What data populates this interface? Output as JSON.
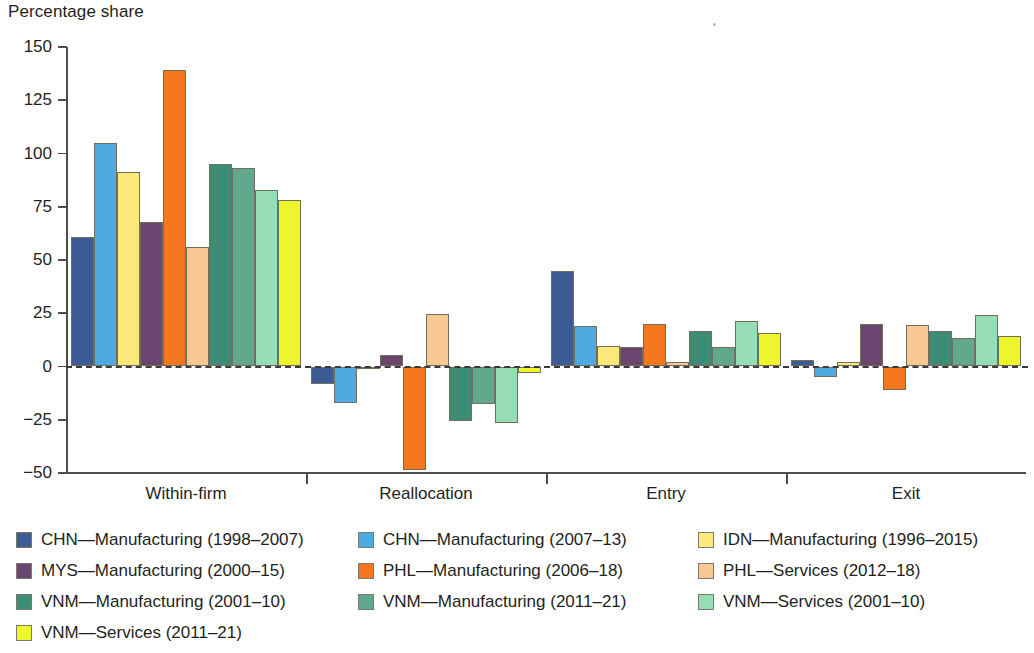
{
  "chart_data": {
    "type": "bar",
    "title": "",
    "ylabel": "Percentage share",
    "xlabel": "",
    "ylim": [
      -50,
      150
    ],
    "yticks": [
      150,
      125,
      100,
      75,
      50,
      25,
      0,
      -25,
      -50
    ],
    "ytick_labels": [
      "150",
      "125",
      "100",
      "75",
      "50",
      "25",
      "0",
      "−25",
      "−50"
    ],
    "grid": false,
    "zero_line": true,
    "legend_position": "below",
    "categories": [
      "Within-firm",
      "Reallocation",
      "Entry",
      "Exit"
    ],
    "series": [
      {
        "name": "CHN—Manufacturing (1998–2007)",
        "color": "#3c5a93",
        "values": [
          61,
          -8,
          45,
          3
        ]
      },
      {
        "name": "CHN—Manufacturing (2007–13)",
        "color": "#4eaae0",
        "values": [
          105,
          -17,
          19,
          -5
        ]
      },
      {
        "name": "IDN—Manufacturing (1996–2015)",
        "color": "#fde87a",
        "values": [
          91.5,
          -1,
          9.5,
          2
        ]
      },
      {
        "name": "MYS—Manufacturing (2000–15)",
        "color": "#6a4570",
        "values": [
          68,
          5.5,
          9,
          20
        ]
      },
      {
        "name": "PHL—Manufacturing (2006–18)",
        "color": "#f4761f",
        "values": [
          139,
          -48.5,
          20,
          -11
        ]
      },
      {
        "name": "PHL—Services (2012–18)",
        "color": "#fbc894",
        "values": [
          56,
          24.5,
          2,
          19.5
        ]
      },
      {
        "name": "VNM—Manufacturing (2001–10)",
        "color": "#3d8d76",
        "values": [
          95,
          -25.5,
          16.5,
          16.5
        ]
      },
      {
        "name": "VNM—Manufacturing (2011–21)",
        "color": "#64a78f",
        "values": [
          93,
          -17.5,
          9,
          13.5
        ]
      },
      {
        "name": "VNM—Services (2001–10)",
        "color": "#96ddb5",
        "values": [
          83,
          -26.5,
          21.5,
          24
        ]
      },
      {
        "name": "VNM—Services (2011–21)",
        "color": "#eef52a",
        "values": [
          78,
          -3,
          15.5,
          14.5
        ]
      }
    ]
  },
  "legend": {
    "rows": [
      [
        {
          "label": "CHN—Manufacturing (1998–2007)",
          "color": "#3c5a93"
        },
        {
          "label": "CHN—Manufacturing (2007–13)",
          "color": "#4eaae0"
        },
        {
          "label": "IDN—Manufacturing (1996–2015)",
          "color": "#fde87a"
        }
      ],
      [
        {
          "label": "MYS—Manufacturing (2000–15)",
          "color": "#6a4570"
        },
        {
          "label": "PHL—Manufacturing (2006–18)",
          "color": "#f4761f"
        },
        {
          "label": "PHL—Services (2012–18)",
          "color": "#fbc894"
        }
      ],
      [
        {
          "label": "VNM—Manufacturing (2001–10)",
          "color": "#3d8d76"
        },
        {
          "label": "VNM—Manufacturing (2011–21)",
          "color": "#64a78f"
        },
        {
          "label": "VNM—Services (2001–10)",
          "color": "#96ddb5"
        }
      ],
      [
        {
          "label": "VNM—Services (2011–21)",
          "color": "#eef52a"
        }
      ]
    ]
  }
}
